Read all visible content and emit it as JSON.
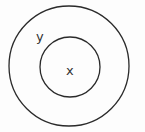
{
  "diagram": {
    "type": "nested-circles",
    "outer": {
      "label": "y",
      "cx": 69,
      "cy": 66,
      "r": 60
    },
    "inner": {
      "label": "x",
      "cx": 70,
      "cy": 67,
      "r": 30
    },
    "stroke_color": "#2a2a2a"
  }
}
